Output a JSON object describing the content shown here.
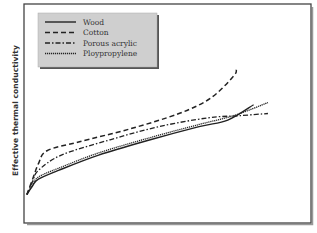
{
  "chart_data": {
    "type": "line",
    "title": "",
    "xlabel": "",
    "ylabel": "Effective thermal conductivity",
    "xlim": [
      0,
      1
    ],
    "ylim": [
      0,
      1
    ],
    "grid": false,
    "legend_position": "top-left",
    "series": [
      {
        "name": "Wood",
        "style": "solid",
        "x": [
          0.01,
          0.03,
          0.05,
          0.12,
          0.26,
          0.44,
          0.61,
          0.71,
          0.8
        ],
        "y": [
          0.13,
          0.17,
          0.2,
          0.24,
          0.31,
          0.38,
          0.44,
          0.47,
          0.54
        ]
      },
      {
        "name": "Cotton",
        "style": "dashed",
        "x": [
          0.01,
          0.03,
          0.05,
          0.08,
          0.19,
          0.37,
          0.54,
          0.65,
          0.73,
          0.74
        ],
        "y": [
          0.13,
          0.2,
          0.27,
          0.33,
          0.37,
          0.43,
          0.5,
          0.57,
          0.67,
          0.7
        ]
      },
      {
        "name": "Porous acrylic",
        "style": "dashdot",
        "x": [
          0.01,
          0.03,
          0.05,
          0.13,
          0.3,
          0.47,
          0.64,
          0.75,
          0.85
        ],
        "y": [
          0.13,
          0.19,
          0.24,
          0.31,
          0.38,
          0.44,
          0.48,
          0.49,
          0.5
        ]
      },
      {
        "name": "Ploypropylene",
        "style": "dotted",
        "x": [
          0.01,
          0.03,
          0.05,
          0.12,
          0.26,
          0.44,
          0.61,
          0.73,
          0.85
        ],
        "y": [
          0.13,
          0.175,
          0.21,
          0.25,
          0.32,
          0.39,
          0.45,
          0.49,
          0.55
        ]
      }
    ]
  }
}
